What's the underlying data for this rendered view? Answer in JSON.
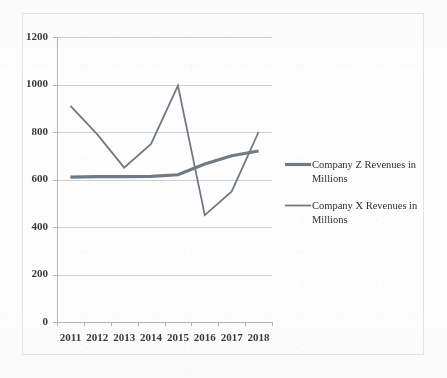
{
  "chart_data": {
    "type": "line",
    "title": "",
    "subtitle": "",
    "xlabel": "",
    "ylabel": "",
    "categories": [
      "2011",
      "2012",
      "2013",
      "2014",
      "2015",
      "2016",
      "2017",
      "2018"
    ],
    "series": [
      {
        "name": "Company Z Revenues in Millions",
        "values": [
          610,
          612,
          612,
          613,
          620,
          665,
          700,
          720
        ],
        "color": "#6f7a85",
        "line_width": 3.2
      },
      {
        "name": "Company X Revenues in Millions",
        "values": [
          910,
          790,
          650,
          750,
          995,
          450,
          550,
          800
        ],
        "color": "#6f7a85",
        "line_width": 1.8
      }
    ],
    "ylim": [
      0,
      1200
    ],
    "ytick_values": [
      0,
      200,
      400,
      600,
      800,
      1000,
      1200
    ],
    "ytick_labels": [
      "0",
      "200",
      "400",
      "600",
      "800",
      "1000",
      "1200"
    ],
    "grid": true,
    "grid_axis": "y",
    "legend_position": "right",
    "legend_entries": [
      "Company Z Revenues in Millions",
      "Company X Revenues in Millions"
    ],
    "axis_colors": {
      "grid": "#cfcfcf",
      "axis": "#b4b4b4",
      "tick_text": "#3a3a3a"
    },
    "background_color": "#fdfdfd",
    "frame_border_color": "#e3e3e3"
  },
  "legend": {
    "items": [
      {
        "label_line1": "Company Z Revenues in",
        "label_line2": "Millions"
      },
      {
        "label_line1": "Company X Revenues in",
        "label_line2": "Millions"
      }
    ]
  }
}
